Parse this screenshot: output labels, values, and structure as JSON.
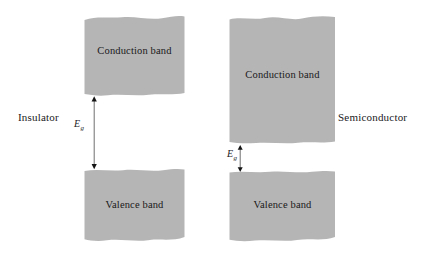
{
  "figure": {
    "background_color": "#ffffff",
    "band_fill_color": "#b5b5b5",
    "text_color": "#19181a"
  },
  "labels": {
    "insulator": "Insulator",
    "semiconductor": "Semiconductor"
  },
  "diagrams": [
    {
      "name": "insulator",
      "side_label": "Insulator",
      "conduction_band": {
        "label": "Conduction band",
        "x": 83,
        "y": 14,
        "width": 103,
        "height": 83
      },
      "valence_band": {
        "label": "Valence band",
        "x": 83,
        "y": 168,
        "width": 103,
        "height": 75
      },
      "band_gap": {
        "symbol": "E",
        "subscript": "g",
        "arrow_x": 94,
        "arrow_top": 97,
        "arrow_bottom": 168,
        "label_x": 74,
        "label_y": 120,
        "size": "large"
      }
    },
    {
      "name": "semiconductor",
      "side_label": "Semiconductor",
      "conduction_band": {
        "label": "Conduction band",
        "x": 228,
        "y": 14,
        "width": 109,
        "height": 131
      },
      "valence_band": {
        "label": "Valence band",
        "x": 228,
        "y": 170,
        "width": 109,
        "height": 73
      },
      "band_gap": {
        "symbol": "E",
        "subscript": "g",
        "arrow_x": 240,
        "arrow_top": 146,
        "arrow_bottom": 170,
        "label_x": 228,
        "label_y": 149,
        "size": "small"
      }
    }
  ]
}
